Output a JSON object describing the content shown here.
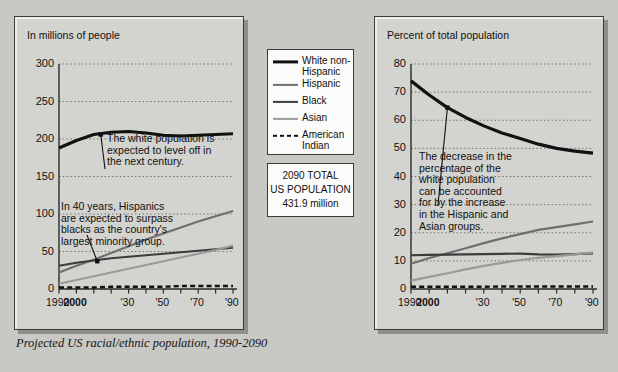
{
  "caption": "Projected US racial/ethnic population, 1990-2090",
  "legend": {
    "items": [
      {
        "label": "White non-Hispanic",
        "color": "#111111",
        "width": 3.2,
        "dashed": false
      },
      {
        "label": "Hispanic",
        "color": "#6f6f6f",
        "width": 2.2,
        "dashed": false
      },
      {
        "label": "Black",
        "color": "#3c3c3c",
        "width": 2.2,
        "dashed": false
      },
      {
        "label": "Asian",
        "color": "#9a9a9a",
        "width": 2.2,
        "dashed": false
      },
      {
        "label": "American Indian",
        "color": "#111111",
        "width": 2.4,
        "dashed": true
      }
    ]
  },
  "total_box": {
    "line1": "2090 TOTAL",
    "line2": "US POPULATION",
    "line3": "431.9 million"
  },
  "annotations": {
    "left_white": "The white population is\nexpected to level off in\nthe next century.",
    "left_hispanic": "In 40 years, Hispanics\nare expected to surpass\nblacks as the country's\nlargest minority group.",
    "right_white": "The decrease in the\npercentage of the\nwhite population\ncan be accounted\nfor by the increase\nin the Hispanic and\nAsian groups."
  },
  "chart_data": [
    {
      "id": "left",
      "type": "line",
      "title": "",
      "xlabel": "",
      "ylabel": "In millions of people",
      "xlim": [
        1990,
        2090
      ],
      "ylim": [
        0,
        300
      ],
      "yticks": [
        0,
        50,
        100,
        150,
        200,
        250,
        300
      ],
      "xticks": [
        1990,
        2000,
        2010,
        2020,
        2030,
        2040,
        2050,
        2060,
        2070,
        2080,
        2090
      ],
      "xticklabels": [
        "1990",
        "2000",
        "",
        "",
        "'30",
        "",
        "'50",
        "",
        "'70",
        "",
        "'90"
      ],
      "grid": "horizontal-dotted",
      "legend_position": "external-center",
      "marker_year": 2010,
      "x": [
        1990,
        2000,
        2010,
        2020,
        2030,
        2040,
        2050,
        2060,
        2070,
        2080,
        2090
      ],
      "series": [
        {
          "name": "White non-Hispanic",
          "color": "#111111",
          "width": 3.2,
          "dashed": false,
          "values": [
            188,
            198,
            206,
            209,
            210,
            208,
            205,
            204,
            205,
            206,
            207
          ]
        },
        {
          "name": "Hispanic",
          "color": "#6f6f6f",
          "width": 2.2,
          "dashed": false,
          "values": [
            22,
            31,
            39,
            48,
            57,
            66,
            74,
            82,
            90,
            97,
            104
          ]
        },
        {
          "name": "Black",
          "color": "#3c3c3c",
          "width": 2.2,
          "dashed": false,
          "values": [
            31,
            35,
            38,
            41,
            43,
            45,
            47,
            49,
            51,
            53,
            55
          ]
        },
        {
          "name": "Asian",
          "color": "#9a9a9a",
          "width": 2.2,
          "dashed": false,
          "values": [
            7,
            12,
            17,
            22,
            27,
            32,
            37,
            42,
            47,
            52,
            58
          ]
        },
        {
          "name": "American Indian",
          "color": "#111111",
          "width": 2.4,
          "dashed": true,
          "values": [
            2,
            2,
            2,
            3,
            3,
            3,
            3,
            4,
            4,
            4,
            4
          ]
        }
      ]
    },
    {
      "id": "right",
      "type": "line",
      "title": "",
      "xlabel": "",
      "ylabel": "Percent of total population",
      "xlim": [
        1990,
        2090
      ],
      "ylim": [
        0,
        80
      ],
      "yticks": [
        0,
        10,
        20,
        30,
        40,
        50,
        60,
        70,
        80
      ],
      "xticks": [
        1990,
        2000,
        2010,
        2020,
        2030,
        2040,
        2050,
        2060,
        2070,
        2080,
        2090
      ],
      "xticklabels": [
        "1990",
        "2000",
        "",
        "",
        "'30",
        "",
        "'50",
        "",
        "'70",
        "",
        "'90"
      ],
      "grid": "horizontal-dotted",
      "legend_position": "external-center",
      "marker_year": 2010,
      "x": [
        1990,
        2000,
        2010,
        2020,
        2030,
        2040,
        2050,
        2060,
        2070,
        2080,
        2090
      ],
      "series": [
        {
          "name": "White non-Hispanic",
          "color": "#111111",
          "width": 3.2,
          "dashed": false,
          "values": [
            74,
            69,
            64.5,
            61,
            58,
            55.5,
            53.5,
            51.5,
            50,
            49,
            48.3
          ]
        },
        {
          "name": "Hispanic",
          "color": "#6f6f6f",
          "width": 2.2,
          "dashed": false,
          "values": [
            9,
            11,
            12.7,
            14.5,
            16.3,
            18,
            19.5,
            21,
            22,
            23,
            24
          ]
        },
        {
          "name": "Black",
          "color": "#3c3c3c",
          "width": 2.2,
          "dashed": false,
          "values": [
            12,
            12.1,
            12.2,
            12.3,
            12.4,
            12.5,
            12.6,
            12.3,
            12.2,
            12.4,
            12.7
          ]
        },
        {
          "name": "Asian",
          "color": "#9a9a9a",
          "width": 2.2,
          "dashed": false,
          "values": [
            3,
            4.3,
            5.6,
            7,
            8.2,
            9.3,
            10.3,
            11.1,
            11.7,
            12.3,
            13
          ]
        },
        {
          "name": "American Indian",
          "color": "#111111",
          "width": 2.4,
          "dashed": true,
          "values": [
            0.8,
            0.8,
            0.8,
            0.8,
            0.8,
            0.9,
            0.9,
            0.9,
            0.9,
            0.9,
            0.9
          ]
        }
      ]
    }
  ]
}
